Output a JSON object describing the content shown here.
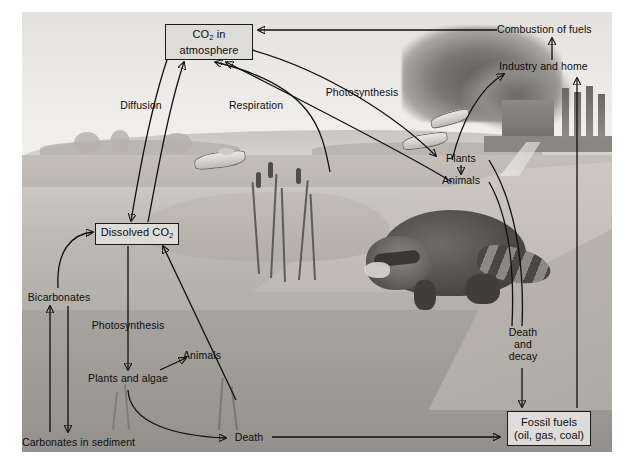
{
  "figure": {
    "type": "diagram",
    "style": "grayscale pencil illustration of a pond / wetland scene with overlaid labelled arrows"
  },
  "boxes": [
    {
      "id": "atmosphere",
      "line1": "CO",
      "sub1": "2",
      "line1_tail": " in",
      "line2": "atmosphere",
      "text": "CO2 in atmosphere"
    },
    {
      "id": "dissolved",
      "line1": "Dissolved CO",
      "sub1": "2",
      "line1_tail": "",
      "line2": "",
      "text": "Dissolved CO2"
    },
    {
      "id": "fossilfuels",
      "line1": "Fossil fuels",
      "sub1": "",
      "line1_tail": "",
      "line2": "(oil, gas, coal)",
      "text": "Fossil fuels (oil, gas, coal)"
    }
  ],
  "labels": {
    "diffusion": "Diffusion",
    "respiration": "Respiration",
    "photosynthesis_air": "Photosynthesis",
    "combustion": "Combustion of fuels",
    "industry": "Industry and home",
    "plants_land": "Plants",
    "animals_land": "Animals",
    "bicarbonates": "Bicarbonates",
    "photosynthesis_water": "Photosynthesis",
    "animals_water": "Animals",
    "plants_algae": "Plants and algae",
    "carbonates": "Carbonates in sediment",
    "death_water": "Death",
    "death_decay_l1": "Death",
    "death_decay_l2": "and",
    "death_decay_l3": "decay"
  },
  "scene": {
    "sky": "hazy grey sky",
    "smoke_plume": "dark smoke plume from factory stacks",
    "factory": "industrial building with four chimney stacks",
    "animal": "raccoon drinking at the water's edge",
    "fish_count": 3,
    "reeds": "cattail reeds in shallow water",
    "waterline_y": 310,
    "horizon_y": 155
  },
  "colors": {
    "page_background": "#ffffff",
    "plate_background": "#d8d6d2",
    "box_fill": "#dedcd8",
    "box_border": "#1a1a1a",
    "arrow_stroke": "#101010",
    "text": "#0d0d0d",
    "water_upper": "#bdbab4",
    "water_lower": "#9d9a95",
    "sediment": "#93908b"
  }
}
